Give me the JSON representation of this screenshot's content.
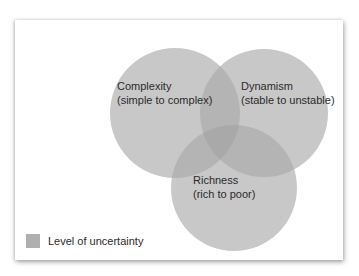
{
  "diagram": {
    "type": "venn",
    "colors": {
      "circle_fill": "#c8c8c8",
      "overlap_fill": "#b3b3b3",
      "center_fill": "#a8a8a8",
      "legend_swatch": "#b0b0b0"
    },
    "circles": [
      {
        "id": "complexity",
        "title": "Complexity",
        "subtitle": "(simple to complex)"
      },
      {
        "id": "dynamism",
        "title": "Dynamism",
        "subtitle": "(stable to unstable)"
      },
      {
        "id": "richness",
        "title": "Richness",
        "subtitle": "(rich to poor)"
      }
    ],
    "legend": {
      "label": "Level of uncertainty"
    }
  }
}
